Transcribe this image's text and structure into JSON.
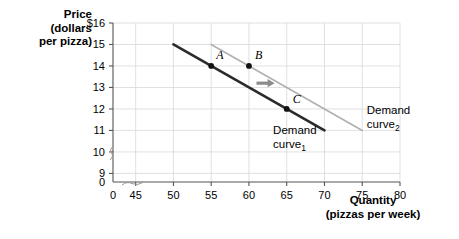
{
  "chart_data": {
    "type": "line",
    "title": "",
    "xlabel": "Quantity",
    "xlabel_sub": "(pizzas per week)",
    "ylabel_line1": "Price",
    "ylabel_line2": "(dollars",
    "ylabel_line3": "per pizza)",
    "xlim": [
      42,
      80
    ],
    "ylim": [
      8.6,
      16
    ],
    "grid": true,
    "legend_position": "inline-annotation",
    "x_ticks": [
      "0",
      "45",
      "50",
      "55",
      "60",
      "65",
      "70",
      "75",
      "80"
    ],
    "x_tick_values": [
      43,
      45,
      50,
      55,
      60,
      65,
      70,
      75,
      80
    ],
    "y_ticks": [
      "$16",
      "15",
      "14",
      "13",
      "12",
      "11",
      "10",
      "9",
      "0"
    ],
    "y_tick_values": [
      16,
      15,
      14,
      13,
      12,
      11,
      10,
      9,
      8.8
    ],
    "axis_break_x": true,
    "axis_break_y": true,
    "series": [
      {
        "name": "Demand curve",
        "subscript": "1",
        "color": "#2b2b2b",
        "width": 2.6,
        "x": [
          50,
          70
        ],
        "values": [
          15,
          11
        ],
        "label_x": 63.2,
        "label_y": 10.85,
        "label_line2_y": 10.2
      },
      {
        "name": "Demand curve",
        "subscript": "2",
        "color": "#b0b0b0",
        "width": 1.6,
        "x": [
          55,
          75
        ],
        "values": [
          15,
          11
        ],
        "label_x": 75.6,
        "label_y": 11.75,
        "label_line2_y": 11.1
      }
    ],
    "points": [
      {
        "label": "A",
        "x": 55,
        "y": 14,
        "on_series": 0,
        "label_dx": 5,
        "label_dy": -7
      },
      {
        "label": "B",
        "x": 60,
        "y": 14,
        "on_series": 1,
        "label_dx": 6,
        "label_dy": -7
      },
      {
        "label": "C",
        "x": 65,
        "y": 12,
        "on_series": 0,
        "label_dx": 6,
        "label_dy": -6
      }
    ],
    "annotations": [
      {
        "type": "arrow",
        "name": "shift-arrow",
        "color": "#8c8c8c",
        "x_start": 61.0,
        "x_end": 63.4,
        "y": 13.2,
        "direction": "right"
      }
    ]
  }
}
